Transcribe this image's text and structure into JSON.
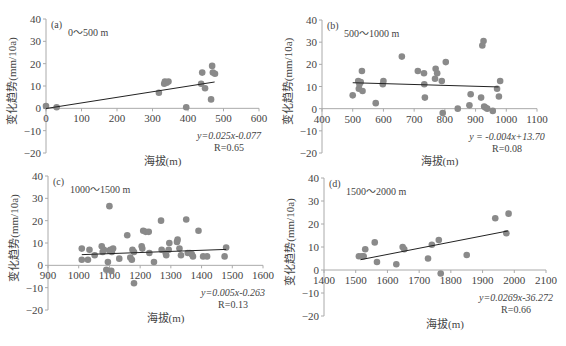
{
  "chart_data": [
    {
      "type": "scatter",
      "panel_label": "(a)",
      "subtitle": "0～500 m",
      "xlabel": "海拔(m)",
      "ylabel": "变化趋势(mm/10a)",
      "xlim": [
        0,
        600
      ],
      "ylim": [
        -20,
        40
      ],
      "xticks": [
        0,
        100,
        200,
        300,
        400,
        500,
        600
      ],
      "yticks": [
        -20,
        -10,
        0,
        10,
        20,
        30,
        40
      ],
      "grid": false,
      "equation": "y=0.025x-0.077",
      "r_label": "R=0.65",
      "trendline": {
        "slope": 0.025,
        "intercept": -0.077,
        "x_range": [
          0,
          475
        ]
      },
      "points": [
        [
          0,
          1
        ],
        [
          30,
          0.5
        ],
        [
          318,
          7
        ],
        [
          333,
          11
        ],
        [
          335,
          12
        ],
        [
          340,
          11.5
        ],
        [
          345,
          12
        ],
        [
          395,
          0.5
        ],
        [
          437,
          11
        ],
        [
          440,
          16
        ],
        [
          448,
          9
        ],
        [
          465,
          4
        ],
        [
          468,
          19
        ],
        [
          470,
          16
        ],
        [
          476,
          15.5
        ]
      ]
    },
    {
      "type": "scatter",
      "panel_label": "(b)",
      "subtitle": "500～1000 m",
      "xlabel": "海拔(m)",
      "ylabel": "变化趋势(mm/10a)",
      "xlim": [
        400,
        1100
      ],
      "ylim": [
        -20,
        40
      ],
      "xticks": [
        400,
        500,
        600,
        700,
        800,
        900,
        1000,
        1100
      ],
      "yticks": [
        -20,
        -10,
        0,
        10,
        20,
        30,
        40
      ],
      "grid": false,
      "equation": "y = -0.004x+13.70",
      "r_label": "R=0.08",
      "trendline": {
        "slope": -0.004,
        "intercept": 13.7,
        "x_range": [
          500,
          975
        ]
      },
      "points": [
        [
          500,
          6
        ],
        [
          518,
          12.5
        ],
        [
          520,
          9
        ],
        [
          522,
          11
        ],
        [
          526,
          12
        ],
        [
          530,
          17
        ],
        [
          532,
          8
        ],
        [
          575,
          2.5
        ],
        [
          598,
          11
        ],
        [
          600,
          12.5
        ],
        [
          660,
          23.5
        ],
        [
          712,
          17
        ],
        [
          732,
          16
        ],
        [
          733,
          11
        ],
        [
          735,
          5
        ],
        [
          768,
          13.5
        ],
        [
          770,
          18
        ],
        [
          775,
          16
        ],
        [
          790,
          12.5
        ],
        [
          793,
          -2
        ],
        [
          803,
          21
        ],
        [
          842,
          0
        ],
        [
          880,
          1.5
        ],
        [
          884,
          6.5
        ],
        [
          918,
          5
        ],
        [
          922,
          28.5
        ],
        [
          926,
          30.5
        ],
        [
          928,
          1
        ],
        [
          932,
          0.5
        ],
        [
          938,
          0
        ],
        [
          956,
          -1
        ],
        [
          970,
          9
        ],
        [
          976,
          5.5
        ],
        [
          980,
          12.5
        ]
      ]
    },
    {
      "type": "scatter",
      "panel_label": "(c)",
      "subtitle": "1000～1500 m",
      "xlabel": "海拔(m)",
      "ylabel": "变化趋势(mm/10a)",
      "xlim": [
        900,
        1600
      ],
      "ylim": [
        -20,
        40
      ],
      "xticks": [
        900,
        1000,
        1100,
        1200,
        1300,
        1400,
        1500,
        1600
      ],
      "yticks": [
        -20,
        -10,
        0,
        10,
        20,
        30,
        40
      ],
      "grid": false,
      "equation": "y=0.005x-0.263",
      "r_label": "R=0.13",
      "trendline": {
        "slope": 0.005,
        "intercept": -0.263,
        "x_range": [
          1010,
          1480
        ]
      },
      "points": [
        [
          1010,
          7.5
        ],
        [
          1010,
          2.5
        ],
        [
          1030,
          2.5
        ],
        [
          1035,
          7
        ],
        [
          1052,
          4.5
        ],
        [
          1075,
          8.5
        ],
        [
          1078,
          6
        ],
        [
          1082,
          7
        ],
        [
          1090,
          -2
        ],
        [
          1095,
          1.5
        ],
        [
          1100,
          26.5
        ],
        [
          1100,
          6.5
        ],
        [
          1103,
          7
        ],
        [
          1106,
          -2.5
        ],
        [
          1108,
          6
        ],
        [
          1112,
          7.5
        ],
        [
          1132,
          3
        ],
        [
          1158,
          13.5
        ],
        [
          1168,
          3.5
        ],
        [
          1173,
          2.5
        ],
        [
          1175,
          7
        ],
        [
          1180,
          6
        ],
        [
          1180,
          -8
        ],
        [
          1205,
          8.5
        ],
        [
          1207,
          7.5
        ],
        [
          1210,
          15.5
        ],
        [
          1218,
          15
        ],
        [
          1228,
          15
        ],
        [
          1230,
          5.5
        ],
        [
          1245,
          1.5
        ],
        [
          1268,
          20
        ],
        [
          1270,
          7
        ],
        [
          1283,
          5.5
        ],
        [
          1285,
          4.5
        ],
        [
          1293,
          7
        ],
        [
          1295,
          10
        ],
        [
          1320,
          10.5
        ],
        [
          1322,
          11.5
        ],
        [
          1328,
          7.5
        ],
        [
          1333,
          4.5
        ],
        [
          1350,
          20.5
        ],
        [
          1355,
          5.5
        ],
        [
          1362,
          5.5
        ],
        [
          1368,
          5
        ],
        [
          1372,
          4
        ],
        [
          1390,
          15.5
        ],
        [
          1405,
          4
        ],
        [
          1418,
          4
        ],
        [
          1475,
          4
        ],
        [
          1480,
          8
        ]
      ]
    },
    {
      "type": "scatter",
      "panel_label": "(d)",
      "subtitle": "1500～2000 m",
      "xlabel": "海拔(m)",
      "ylabel": "变化趋势(mm/10a)",
      "xlim": [
        1400,
        2100
      ],
      "ylim": [
        -20,
        40
      ],
      "xticks": [
        1400,
        1500,
        1600,
        1700,
        1800,
        1900,
        2000,
        2100
      ],
      "yticks": [
        -20,
        -10,
        0,
        10,
        20,
        30,
        40
      ],
      "grid": false,
      "equation": "y=0.0269x-36.272",
      "r_label": "R=0.66",
      "trendline": {
        "slope": 0.0269,
        "intercept": -36.272,
        "x_range": [
          1515,
          1980
        ]
      },
      "points": [
        [
          1510,
          6
        ],
        [
          1520,
          6
        ],
        [
          1525,
          6
        ],
        [
          1530,
          9
        ],
        [
          1560,
          12
        ],
        [
          1567,
          3.5
        ],
        [
          1628,
          2.5
        ],
        [
          1648,
          10
        ],
        [
          1653,
          9
        ],
        [
          1728,
          5
        ],
        [
          1740,
          11
        ],
        [
          1762,
          13
        ],
        [
          1768,
          -1.5
        ],
        [
          1850,
          6.5
        ],
        [
          1940,
          22.5
        ],
        [
          1975,
          16
        ],
        [
          1982,
          24.5
        ]
      ]
    }
  ],
  "panels_layout": [
    {
      "left": 0,
      "top": 0,
      "width": 280,
      "height": 170,
      "ox": 46,
      "ox_right": 259,
      "oy_top": 19,
      "oy_bottom": 153
    },
    {
      "left": 280,
      "top": 0,
      "width": 286,
      "height": 170,
      "ox": 42,
      "ox_right": 257,
      "oy_top": 20,
      "oy_bottom": 153
    },
    {
      "left": 0,
      "top": 170,
      "width": 280,
      "height": 168,
      "ox": 48,
      "ox_right": 263,
      "oy_top": 6,
      "oy_bottom": 140
    },
    {
      "left": 280,
      "top": 170,
      "width": 286,
      "height": 168,
      "ox": 44,
      "ox_right": 266,
      "oy_top": 8,
      "oy_bottom": 146
    }
  ],
  "style": {
    "marker_color": "#8a8a8a",
    "line_color": "#222222",
    "axis_color": "#aaaaaa",
    "text_color": "#444444"
  }
}
